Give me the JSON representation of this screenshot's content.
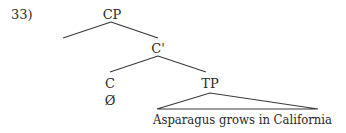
{
  "example_number": "33)",
  "nodes": {
    "cp": "CP",
    "c_bar": "C'",
    "c": "C",
    "c_content": "Ø",
    "tp": "TP",
    "tp_content": "Asparagus grows in California"
  }
}
